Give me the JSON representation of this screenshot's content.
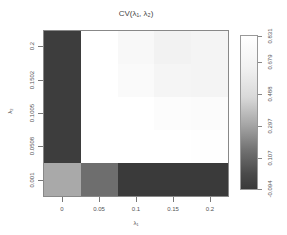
{
  "chart_data": {
    "type": "heatmap",
    "title": "CV(λ₁, λ₂)",
    "xlabel": "λ₁",
    "ylabel": "λ₂",
    "x": [
      "0",
      "0.05",
      "0.1",
      "0.15",
      "0.2"
    ],
    "y": [
      "0.001",
      "0.0508",
      "0.1005",
      "0.1502",
      "0.2"
    ],
    "values_by_row_top_to_bottom": [
      [
        -0.06,
        0.83,
        0.8,
        0.77,
        0.78
      ],
      [
        -0.06,
        0.83,
        0.81,
        0.78,
        0.78
      ],
      [
        -0.06,
        0.83,
        0.83,
        0.82,
        0.81
      ],
      [
        -0.06,
        0.83,
        0.83,
        0.83,
        0.83
      ],
      [
        0.35,
        0.17,
        -0.09,
        -0.09,
        -0.09
      ]
    ],
    "row_labels_top_to_bottom": [
      "0.2",
      "0.1502",
      "0.1005",
      "0.0508",
      "0.001"
    ],
    "colorscale": "grayscale",
    "legend": {
      "position": "right",
      "ticks": [
        "-0.094",
        "0.107",
        "0.297",
        "0.488",
        "0.679",
        "0.831"
      ],
      "range": [
        -0.094,
        0.831
      ]
    },
    "grid": false
  },
  "cell_colors_top_to_bottom": [
    [
      "#3d3d3d",
      "#ffffff",
      "#f8f8f8",
      "#f2f2f2",
      "#f4f4f4"
    ],
    [
      "#3d3d3d",
      "#ffffff",
      "#fafafa",
      "#f5f5f5",
      "#f4f4f4"
    ],
    [
      "#3d3d3d",
      "#ffffff",
      "#ffffff",
      "#fcfcfc",
      "#fbfbfb"
    ],
    [
      "#3d3d3d",
      "#ffffff",
      "#ffffff",
      "#ffffff",
      "#fefefe"
    ],
    [
      "#a9a9a9",
      "#6e6e6e",
      "#3a3a3a",
      "#3a3a3a",
      "#3a3a3a"
    ]
  ]
}
